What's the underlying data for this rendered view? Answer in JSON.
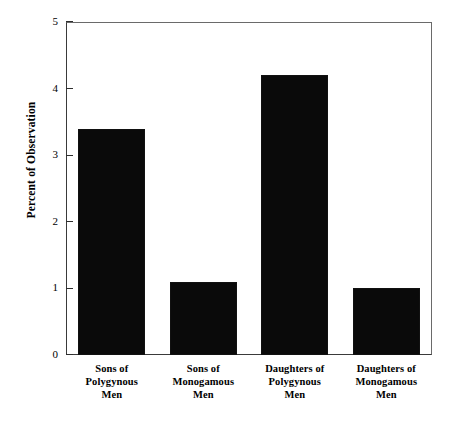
{
  "chart_data": {
    "type": "bar",
    "title": "",
    "subtitle": "",
    "xlabel": "",
    "ylabel": "Percent of Observation",
    "categories": [
      "Sons of\nPolygynous\nMen",
      "Sons of\nMonogamous\nMen",
      "Daughters of\nPolygynous\nMen",
      "Daughters of\nMonogamous\nMen"
    ],
    "values": [
      3.4,
      1.1,
      4.2,
      1.0
    ],
    "ylim": [
      0,
      5
    ],
    "ytick_labels": [
      "0",
      "1",
      "2",
      "3",
      "4",
      "5"
    ],
    "ytick_values": [
      0,
      1,
      2,
      3,
      4,
      5
    ],
    "grid": false,
    "legend": false,
    "legend_position": "none",
    "bar_color": "#0a0a0a",
    "axis_color": "#2e2e2e",
    "background_color": "#ffffff"
  }
}
